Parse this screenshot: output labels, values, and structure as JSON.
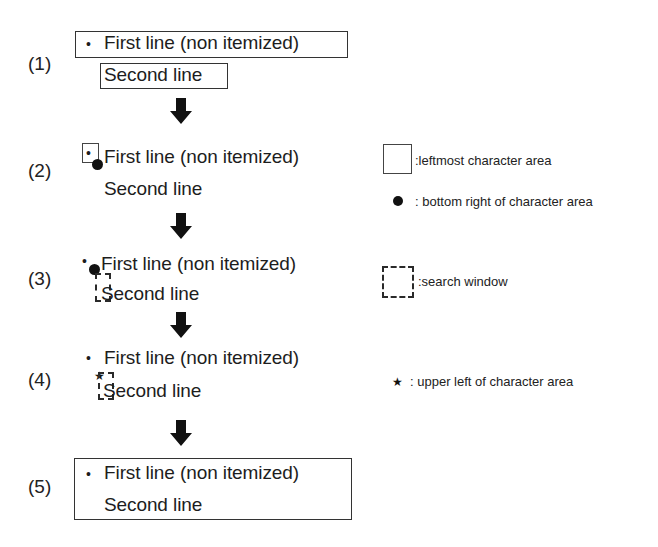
{
  "diagram": {
    "steps": [
      {
        "id": 1,
        "label": "(1)",
        "bullet": "•",
        "first_line": "First line (non itemized)",
        "second_line": "Second line",
        "markers": [
          "first-line-box",
          "second-line-box"
        ]
      },
      {
        "id": 2,
        "label": "(2)",
        "bullet": "•",
        "first_line": "First line (non itemized)",
        "second_line": "Second line",
        "markers": [
          "leftmost-character-area",
          "bottom-right-dot"
        ]
      },
      {
        "id": 3,
        "label": "(3)",
        "bullet": "•",
        "first_line": "First line (non itemized)",
        "second_line": "Second line",
        "markers": [
          "bottom-right-dot",
          "search-window"
        ]
      },
      {
        "id": 4,
        "label": "(4)",
        "bullet": "•",
        "first_line": "First line (non itemized)",
        "second_line": "Second line",
        "markers": [
          "upper-left-star",
          "search-window"
        ]
      },
      {
        "id": 5,
        "label": "(5)",
        "bullet": "•",
        "first_line": "First line (non itemized)",
        "second_line": "Second line",
        "markers": [
          "merged-paragraph-box"
        ]
      }
    ],
    "arrows": 4,
    "legend": [
      {
        "symbol": "solid-square",
        "text": ":leftmost character area"
      },
      {
        "symbol": "filled-dot",
        "text": ": bottom right of character area"
      },
      {
        "symbol": "dashed-square",
        "text": ":search window"
      },
      {
        "symbol": "star",
        "glyph": "★",
        "text": ": upper left of character area"
      }
    ],
    "colors": {
      "ink": "#1a1a1a",
      "background": "#ffffff"
    }
  }
}
